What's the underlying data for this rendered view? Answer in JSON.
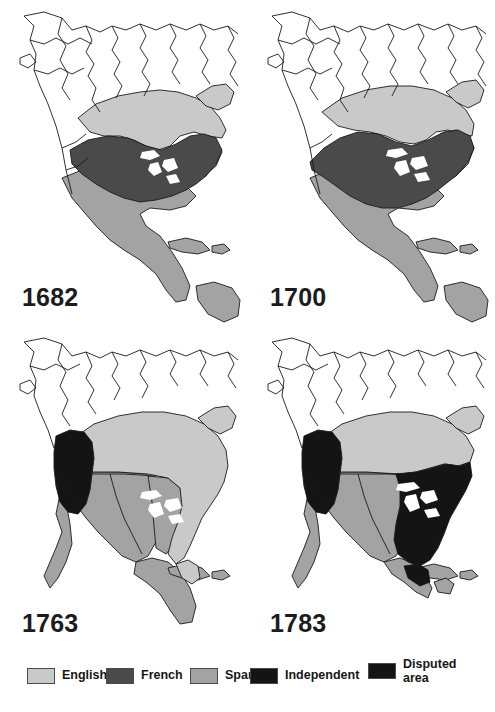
{
  "figure": {
    "panel_count": 4,
    "background": "#ffffff"
  },
  "colors": {
    "english": "#c9c9c9",
    "french": "#4a4a4a",
    "spanish": "#a3a3a3",
    "independent": "#141414",
    "disputed": "#141414",
    "unclaimed": "#ffffff",
    "outline": "#1a1a1a",
    "label": "#1c1c1c"
  },
  "panels": [
    {
      "id": "panel-1682",
      "year": "1682",
      "territories": [
        "english",
        "french",
        "spanish"
      ],
      "notes": "English along Atlantic seaboard and Hudson Bay; French through Great Lakes and Mississippi valley; Spanish in Mexico, Florida and the Caribbean."
    },
    {
      "id": "panel-1700",
      "year": "1700",
      "territories": [
        "english",
        "french",
        "spanish"
      ],
      "notes": "French claim expanded across the interior; English narrowed to the Atlantic coast and Hudson Bay."
    },
    {
      "id": "panel-1763",
      "year": "1763",
      "territories": [
        "english",
        "spanish",
        "disputed"
      ],
      "notes": "French claims gone; English east of the Mississippi and across Canada; Spanish hold Louisiana and Mexico; Pacific Northwest disputed."
    },
    {
      "id": "panel-1783",
      "year": "1783",
      "territories": [
        "english",
        "spanish",
        "independent",
        "disputed"
      ],
      "notes": "United States independent east of the Mississippi; English in Canada; Spanish in Louisiana and Mexico; Pacific Northwest disputed."
    }
  ],
  "legend": {
    "items": [
      {
        "key": "english",
        "label": "English",
        "color": "#c9c9c9"
      },
      {
        "key": "french",
        "label": "French",
        "color": "#4a4a4a"
      },
      {
        "key": "spanish",
        "label": "Spanish",
        "color": "#a3a3a3"
      },
      {
        "key": "independent",
        "label": "Independent",
        "color": "#141414"
      },
      {
        "key": "disputed",
        "label": "Disputed\narea",
        "color": "#141414"
      }
    ]
  }
}
